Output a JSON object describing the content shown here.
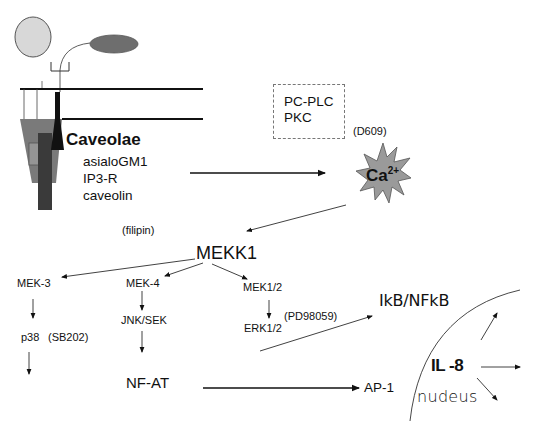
{
  "diagram": {
    "membrane": {
      "caveolae_label": "Caveolae",
      "components": [
        "asialoGM1",
        "IP3-R",
        "caveolin"
      ]
    },
    "signaling_box": {
      "items": [
        "PC-PLC",
        "PKC"
      ]
    },
    "inhibitors": {
      "d609": "(D609)",
      "filipin": "(filipin)",
      "sb202": "(SB202)",
      "pd98059": "(PD98059)"
    },
    "calcium": {
      "base": "Ca",
      "charge": "2+"
    },
    "kinases": {
      "mekk1": "MEKK1",
      "mek3": "MEK-3",
      "mek4": "MEK-4",
      "mek12": "MEK1/2",
      "p38": "p38",
      "jnk_sek": "JNK/SEK",
      "erk12": "ERK1/2"
    },
    "transcription_factors": {
      "nfat": "NF-AT",
      "ap1": "AP-1",
      "ikb_nfkb": "IkB/NFkB"
    },
    "nucleus": {
      "label": "nudeus",
      "gene": "IL -8"
    },
    "colors": {
      "line": "#111111",
      "light_oval": "#d8d8d8",
      "dark_oval": "#6e6e6e",
      "caveola_funnel": "#7a7a7a",
      "caveola_bar": "#3a3a3a",
      "star_fill": "#9a9a9a"
    }
  }
}
